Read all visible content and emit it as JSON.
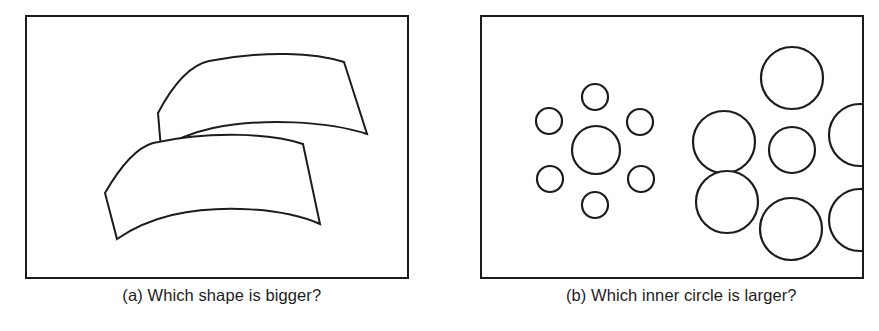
{
  "figure": {
    "type": "visual-illusion-figure",
    "background_color": "#ffffff",
    "stroke_color": "#1c1c1c",
    "fill_color": "#ffffff",
    "panel_count": 2
  },
  "subfigures": [
    {
      "id": "a",
      "label": "(a)",
      "caption": "(a) Which shape is bigger?",
      "illusion_name": "Jastrow illusion",
      "frame": {
        "x": 25,
        "y": 15,
        "width": 384,
        "height": 264
      },
      "shapes": [
        {
          "name": "upper-curved-shape",
          "path": "M 131 96 C 150 60 168 47 182 44 C 240 33 288 36 317 45 L 340 117 C 300 104 236 101 186 111 C 163 116 146 124 134 132 Z"
        },
        {
          "name": "lower-curved-shape",
          "path": "M 78 176 C 97 143 112 130 126 126 C 186 113 246 117 276 127 L 293 207 C 256 191 194 187 145 198 C 120 204 103 213 90 222 Z"
        }
      ]
    },
    {
      "id": "b",
      "label": "(b)",
      "caption": "(b) Which inner circle is larger?",
      "illusion_name": "Ebbinghaus illusion",
      "frame": {
        "x": 40,
        "y": 15,
        "width": 384,
        "height": 264
      },
      "clusters": [
        {
          "name": "left-cluster-small-surrounders",
          "inner_circle": {
            "cx": 114,
            "cy": 133,
            "r": 24
          },
          "surrounders": [
            {
              "cx": 113,
              "cy": 80,
              "r": 13
            },
            {
              "cx": 67,
              "cy": 104,
              "r": 13
            },
            {
              "cx": 158,
              "cy": 105,
              "r": 13
            },
            {
              "cx": 68,
              "cy": 162,
              "r": 13
            },
            {
              "cx": 159,
              "cy": 162,
              "r": 13
            },
            {
              "cx": 113,
              "cy": 188,
              "r": 13
            }
          ]
        },
        {
          "name": "right-cluster-large-surrounders",
          "inner_circle": {
            "cx": 310,
            "cy": 133,
            "r": 23
          },
          "surrounders": [
            {
              "cx": 310,
              "cy": 61,
              "r": 31
            },
            {
              "cx": 242,
              "cy": 125,
              "r": 31
            },
            {
              "cx": 378,
              "cy": 118,
              "r": 31
            },
            {
              "cx": 245,
              "cy": 185,
              "r": 31
            },
            {
              "cx": 309,
              "cy": 212,
              "r": 31
            },
            {
              "cx": 378,
              "cy": 203,
              "r": 31
            }
          ]
        }
      ]
    }
  ]
}
